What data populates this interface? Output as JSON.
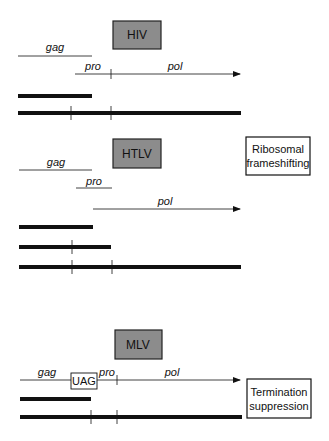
{
  "colors": {
    "virus_box_fill": "#8c8c8c",
    "line": "#111111",
    "background": "#ffffff"
  },
  "sections": [
    {
      "virus": "HIV",
      "genes": {
        "gag": "gag",
        "pro": "pro",
        "pol": "pol"
      }
    },
    {
      "virus": "HTLV",
      "genes": {
        "gag": "gag",
        "pro": "pro",
        "pol": "pol"
      },
      "mechanism": [
        "Ribosomal",
        "frameshifting"
      ]
    },
    {
      "virus": "MLV",
      "genes": {
        "gag": "gag",
        "pro": "pro",
        "pol": "pol"
      },
      "stop_codon": "UAG",
      "mechanism": [
        "Termination",
        "suppression"
      ]
    }
  ]
}
